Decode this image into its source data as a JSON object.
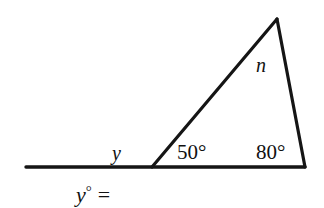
{
  "figure": {
    "stroke_color": "#151515",
    "background_color": "#ffffff",
    "line_width": 3,
    "baseline": {
      "x1": 26,
      "y1": 167,
      "x2": 305,
      "y2": 167
    },
    "triangle": {
      "vertex_left": {
        "x": 152,
        "y": 167
      },
      "vertex_right": {
        "x": 305,
        "y": 167
      },
      "vertex_apex": {
        "x": 277,
        "y": 19
      }
    },
    "labels": {
      "exterior_angle": "y",
      "apex_angle": "n",
      "interior_angle_left": "50°",
      "interior_angle_right": "80°"
    }
  },
  "answer_prompt": {
    "variable": "y",
    "degree_symbol": "°",
    "equals": "=",
    "value": ""
  }
}
